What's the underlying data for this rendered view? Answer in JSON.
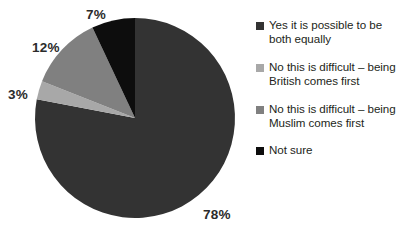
{
  "chart_data": {
    "type": "pie",
    "title": "",
    "subtitle": "",
    "xlabel": "",
    "ylabel": "",
    "grid": false,
    "legend_position": "right",
    "start_angle_deg": 0,
    "direction": "clockwise",
    "categories": [
      "Yes it is possible to be both equally",
      "No this is difficult – being British comes first",
      "No this is difficult – being Muslim comes first",
      "Not sure"
    ],
    "values": [
      78,
      3,
      12,
      7
    ],
    "value_unit": "%",
    "data_labels": [
      "78%",
      "3%",
      "12%",
      "7%"
    ],
    "colors": [
      "#333333",
      "#a8a8a8",
      "#808080",
      "#0d0d0d"
    ],
    "slices": [
      {
        "label": "Yes it is possible to be both equally",
        "value": 78,
        "data_label": "78%",
        "color": "#333333",
        "legend_swatch": "#333333"
      },
      {
        "label": "No this is difficult – being British comes first",
        "value": 3,
        "data_label": "3%",
        "color": "#a8a8a8",
        "legend_swatch": "#a8a8a8"
      },
      {
        "label": "No this is difficult – being Muslim comes first",
        "value": 12,
        "data_label": "12%",
        "color": "#808080",
        "legend_swatch": "#808080"
      },
      {
        "label": "Not sure",
        "value": 7,
        "data_label": "7%",
        "color": "#0d0d0d",
        "legend_swatch": "#0d0d0d"
      }
    ]
  },
  "labels": {
    "equally_pct": "78%",
    "british_pct": "3%",
    "muslim_pct": "12%",
    "not_sure_pct": "7%"
  },
  "legend": {
    "items": [
      {
        "label": "Yes it is possible to be both equally",
        "swatch_name": "legend-swatch-yes-equally",
        "color": "#333333"
      },
      {
        "label": "No this is difficult – being British comes first",
        "swatch_name": "legend-swatch-british-first",
        "color": "#a8a8a8"
      },
      {
        "label": "No this is difficult – being Muslim comes first",
        "swatch_name": "legend-swatch-muslim-first",
        "color": "#808080"
      },
      {
        "label": "Not sure",
        "swatch_name": "legend-swatch-not-sure",
        "color": "#0d0d0d"
      }
    ]
  },
  "colors": {
    "background": "#ffffff",
    "text": "#231f20",
    "slice_major": "#333333",
    "slice_light_gray": "#a8a8a8",
    "slice_mid_gray": "#808080",
    "slice_black": "#0d0d0d"
  }
}
